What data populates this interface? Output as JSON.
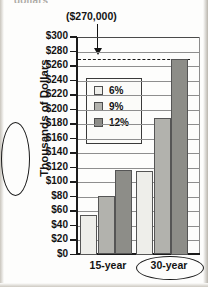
{
  "page": {
    "cut_heading": "dollars"
  },
  "annotation": {
    "callout_label": "($270,000)",
    "arrow_icon": "down-arrow-icon",
    "reference_value": 270
  },
  "axis": {
    "y_title": "Thousands of Dollars",
    "y_ticks": [
      "$300",
      "$280",
      "$260",
      "$240",
      "$220",
      "$200",
      "$180",
      "$160",
      "$140",
      "$120",
      "$100",
      "$80",
      "$60",
      "$40",
      "$20",
      "$0"
    ],
    "x_ticks": [
      "15-year",
      "30-year"
    ]
  },
  "legend": {
    "entries": [
      {
        "label": "6%",
        "color": "#eeeeea"
      },
      {
        "label": "9%",
        "color": "#b2b2ad"
      },
      {
        "label": "12%",
        "color": "#8d8d88"
      }
    ]
  },
  "chart_data": {
    "type": "bar",
    "xlabel": "",
    "ylabel": "Thousands of Dollars",
    "categories": [
      "15-year",
      "30-year"
    ],
    "series": [
      {
        "name": "6%",
        "color": "#eeeeea",
        "values": [
          55,
          115
        ]
      },
      {
        "name": "9%",
        "color": "#b2b2ad",
        "values": [
          81,
          188
        ]
      },
      {
        "name": "12%",
        "color": "#8d8d88",
        "values": [
          117,
          270
        ]
      }
    ],
    "ylim": [
      0,
      300
    ],
    "ytick_step": 20,
    "grid": true,
    "legend_position": "inside-upper-left",
    "annotations": [
      {
        "text": "($270,000)",
        "points_to_series": "12%",
        "points_to_category": "30-year",
        "value": 270,
        "style": "arrow-with-dashed-reference-line"
      }
    ],
    "highlights": [
      "30-year",
      "Thousands of Dollars"
    ]
  }
}
